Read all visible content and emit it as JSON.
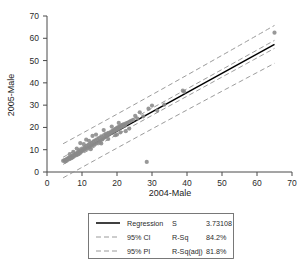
{
  "chart_data": {
    "type": "scatter",
    "title": "",
    "xlabel": "2004-Male",
    "ylabel": "2005-Male",
    "xlim": [
      0,
      70
    ],
    "ylim": [
      0,
      70
    ],
    "xticks": [
      0,
      10,
      20,
      30,
      40,
      50,
      60,
      70
    ],
    "yticks": [
      0,
      10,
      20,
      30,
      40,
      50,
      60,
      70
    ],
    "grid": false,
    "legend_position": "bottom-center",
    "point_color": "#8a8a8a",
    "line_color": "#000000",
    "band_color": "#8f8f8f",
    "regression": {
      "label": "Regression",
      "slope": 0.865,
      "intercept": 1.05,
      "style": "solid"
    },
    "bands": [
      {
        "label": "95% CI",
        "style": "dashed",
        "halfwidth_at_mean": 1.6
      },
      {
        "label": "95% PI",
        "style": "dashed",
        "halfwidth_at_mean": 7.6
      }
    ],
    "points": [
      [
        4.6,
        5.0
      ],
      [
        5.0,
        5.3
      ],
      [
        5.2,
        4.7
      ],
      [
        5.4,
        5.6
      ],
      [
        5.6,
        5.1
      ],
      [
        5.8,
        6.0
      ],
      [
        6.0,
        5.5
      ],
      [
        6.2,
        6.3
      ],
      [
        6.4,
        5.9
      ],
      [
        6.6,
        6.6
      ],
      [
        6.8,
        6.2
      ],
      [
        7.0,
        7.0
      ],
      [
        7.2,
        6.5
      ],
      [
        7.4,
        7.4
      ],
      [
        7.6,
        6.9
      ],
      [
        7.8,
        7.8
      ],
      [
        8.0,
        7.3
      ],
      [
        8.2,
        8.2
      ],
      [
        8.4,
        7.7
      ],
      [
        8.6,
        8.6
      ],
      [
        8.8,
        8.0
      ],
      [
        9.0,
        9.2
      ],
      [
        9.2,
        8.4
      ],
      [
        9.4,
        9.6
      ],
      [
        9.6,
        8.8
      ],
      [
        9.8,
        10.1
      ],
      [
        10.0,
        9.3
      ],
      [
        10.3,
        10.6
      ],
      [
        10.5,
        9.7
      ],
      [
        10.8,
        11.0
      ],
      [
        11.0,
        10.2
      ],
      [
        11.3,
        11.6
      ],
      [
        11.5,
        10.6
      ],
      [
        11.8,
        12.1
      ],
      [
        12.0,
        11.0
      ],
      [
        12.3,
        12.6
      ],
      [
        12.5,
        11.4
      ],
      [
        12.8,
        13.1
      ],
      [
        13.0,
        11.9
      ],
      [
        13.3,
        13.7
      ],
      [
        13.5,
        12.3
      ],
      [
        13.8,
        14.2
      ],
      [
        14.0,
        12.7
      ],
      [
        14.3,
        14.7
      ],
      [
        14.5,
        13.1
      ],
      [
        14.8,
        15.2
      ],
      [
        15.0,
        13.6
      ],
      [
        15.3,
        14.2
      ],
      [
        15.5,
        16.0
      ],
      [
        15.8,
        14.6
      ],
      [
        16.0,
        15.1
      ],
      [
        16.3,
        16.6
      ],
      [
        16.5,
        15.5
      ],
      [
        16.8,
        17.1
      ],
      [
        17.0,
        16.0
      ],
      [
        17.3,
        16.4
      ],
      [
        17.5,
        17.6
      ],
      [
        17.8,
        16.9
      ],
      [
        18.0,
        17.3
      ],
      [
        18.3,
        18.1
      ],
      [
        18.5,
        17.7
      ],
      [
        18.8,
        18.6
      ],
      [
        19.0,
        18.1
      ],
      [
        19.2,
        19.0
      ],
      [
        19.4,
        18.5
      ],
      [
        19.6,
        19.4
      ],
      [
        19.8,
        18.9
      ],
      [
        20.0,
        19.8
      ],
      [
        20.2,
        19.2
      ],
      [
        20.4,
        20.2
      ],
      [
        20.6,
        19.6
      ],
      [
        20.8,
        20.5
      ],
      [
        21.0,
        20.0
      ],
      [
        21.2,
        20.9
      ],
      [
        21.4,
        20.3
      ],
      [
        21.6,
        21.2
      ],
      [
        21.8,
        20.6
      ],
      [
        22.0,
        21.5
      ],
      [
        22.3,
        20.9
      ],
      [
        22.6,
        21.8
      ],
      [
        23.0,
        22.1
      ],
      [
        23.5,
        22.5
      ],
      [
        24.0,
        23.0
      ],
      [
        24.6,
        23.4
      ],
      [
        25.2,
        25.2
      ],
      [
        25.8,
        24.0
      ],
      [
        26.5,
        26.8
      ],
      [
        27.5,
        25.0
      ],
      [
        28.5,
        4.5
      ],
      [
        29.0,
        28.4
      ],
      [
        30.0,
        29.8
      ],
      [
        31.5,
        27.5
      ],
      [
        33.5,
        30.2
      ],
      [
        38.8,
        36.5
      ],
      [
        39.2,
        36.0
      ],
      [
        65.0,
        62.5
      ],
      [
        9.5,
        13.0
      ],
      [
        11.2,
        14.5
      ],
      [
        13.0,
        16.2
      ],
      [
        16.2,
        18.8
      ],
      [
        18.5,
        20.4
      ],
      [
        20.5,
        22.0
      ],
      [
        7.5,
        9.0
      ],
      [
        8.5,
        10.5
      ],
      [
        10.5,
        12.5
      ],
      [
        12.0,
        14.0
      ],
      [
        19.5,
        16.5
      ],
      [
        21.0,
        17.8
      ],
      [
        22.5,
        18.3
      ],
      [
        17.5,
        14.8
      ],
      [
        15.5,
        12.8
      ],
      [
        6.5,
        8.0
      ],
      [
        23.5,
        19.5
      ],
      [
        20.0,
        16.8
      ],
      [
        14.0,
        16.8
      ],
      [
        12.5,
        10.2
      ]
    ]
  },
  "legend": {
    "entries": [
      {
        "label": "Regression",
        "style": "solid"
      },
      {
        "label": "95% CI",
        "style": "dashed"
      },
      {
        "label": "95% PI",
        "style": "dashed"
      }
    ],
    "stats": [
      {
        "name": "S",
        "value": "3.73108"
      },
      {
        "name": "R-Sq",
        "value": "84.2%"
      },
      {
        "name": "R-Sq(adj)",
        "value": "81.8%"
      }
    ]
  }
}
